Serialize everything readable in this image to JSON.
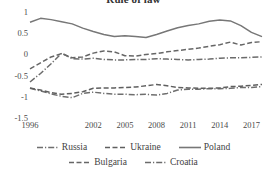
{
  "chart_data": {
    "type": "line",
    "title": "Rule of law",
    "xlabel": "",
    "ylabel": "",
    "ylim": [
      -1.5,
      1
    ],
    "yticks": [
      "1",
      "0.5",
      "0",
      "-0.5",
      "-1",
      "-1.5"
    ],
    "ytick_values": [
      1,
      0.5,
      0,
      -0.5,
      -1,
      -1.5
    ],
    "xticks": [
      "1996",
      "2002",
      "2005",
      "2008",
      "2011",
      "2014",
      "2017"
    ],
    "xtick_values": [
      1996,
      2002,
      2005,
      2008,
      2011,
      2014,
      2017
    ],
    "xlim": [
      1996,
      2018
    ],
    "x": [
      1996,
      1997,
      1998,
      1999,
      2000,
      2001,
      2002,
      2003,
      2004,
      2005,
      2006,
      2007,
      2008,
      2009,
      2010,
      2011,
      2012,
      2013,
      2014,
      2015,
      2016,
      2017,
      2018
    ],
    "grid": false,
    "legend_position": "bottom",
    "series": [
      {
        "name": "Russia",
        "style": "dash-dot",
        "color": "#6e6e6e",
        "values": [
          -0.8,
          -0.86,
          -0.93,
          -0.99,
          -1.02,
          -0.92,
          -0.89,
          -0.92,
          -0.94,
          -0.94,
          -0.95,
          -0.94,
          -0.96,
          -0.92,
          -0.84,
          -0.82,
          -0.82,
          -0.81,
          -0.81,
          -0.8,
          -0.78,
          -0.78,
          -0.76
        ]
      },
      {
        "name": "Ukraine",
        "style": "dashed",
        "color": "#5f5f5f",
        "values": [
          -0.79,
          -0.84,
          -0.9,
          -0.94,
          -0.92,
          -0.88,
          -0.8,
          -0.79,
          -0.79,
          -0.78,
          -0.77,
          -0.74,
          -0.71,
          -0.74,
          -0.78,
          -0.79,
          -0.8,
          -0.8,
          -0.79,
          -0.76,
          -0.75,
          -0.73,
          -0.71
        ]
      },
      {
        "name": "Poland",
        "style": "solid",
        "color": "#777777",
        "values": [
          0.76,
          0.85,
          0.82,
          0.77,
          0.72,
          0.62,
          0.54,
          0.47,
          0.42,
          0.44,
          0.42,
          0.4,
          0.47,
          0.55,
          0.63,
          0.68,
          0.72,
          0.78,
          0.81,
          0.79,
          0.68,
          0.52,
          0.42
        ]
      },
      {
        "name": "Bulgaria",
        "style": "dashed",
        "color": "#666666",
        "values": [
          -0.34,
          -0.2,
          -0.06,
          0.02,
          -0.08,
          -0.06,
          0.03,
          0.08,
          0.06,
          -0.03,
          -0.04,
          0.0,
          0.02,
          0.06,
          0.09,
          0.12,
          0.15,
          0.19,
          0.23,
          0.29,
          0.22,
          0.28,
          0.3
        ]
      },
      {
        "name": "Croatia",
        "style": "dash-dot",
        "color": "#6b6b6b",
        "values": [
          -0.65,
          -0.45,
          -0.22,
          0.03,
          -0.1,
          -0.11,
          -0.09,
          -0.12,
          -0.13,
          -0.13,
          -0.12,
          -0.12,
          -0.1,
          -0.11,
          -0.12,
          -0.13,
          -0.12,
          -0.11,
          -0.09,
          -0.08,
          -0.08,
          -0.07,
          -0.06
        ]
      }
    ]
  }
}
